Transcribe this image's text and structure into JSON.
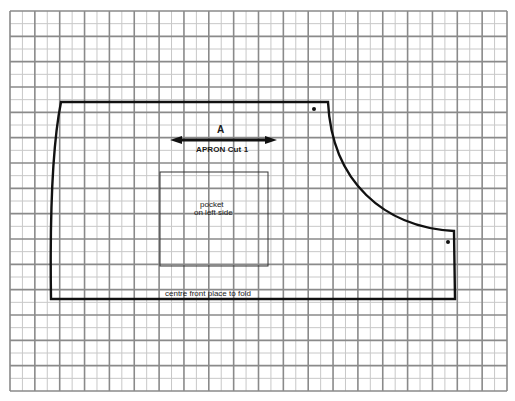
{
  "diagram": {
    "type": "sewing-pattern",
    "grid": {
      "left": 10,
      "top": 11,
      "right": 507,
      "bottom": 391,
      "major_cols": 20,
      "major_rows": 15,
      "minor_per_major": 2,
      "major_color": "#8a8a8a",
      "minor_color": "#c8c8c8"
    },
    "pattern_piece": {
      "name": "APRON",
      "stroke_color": "#111111",
      "outline_points": {
        "top_left": [
          61,
          102
        ],
        "top_right": [
          328,
          102
        ],
        "curve_end": [
          454,
          231
        ],
        "right_bottom": [
          455,
          299
        ],
        "bottom_left": [
          51,
          299
        ]
      }
    },
    "labels": {
      "grainline_letter": "A",
      "piece_title": "APRON Cut 1",
      "pocket_line1": "pocket",
      "pocket_line2": "on left side",
      "fold_edge": "centre front place to fold"
    },
    "grainline_arrow": {
      "x1": 170,
      "x2": 277,
      "y": 140
    },
    "pocket": {
      "x": 160,
      "y": 172,
      "width": 108,
      "height": 94
    },
    "markers": [
      {
        "name": "dot-top",
        "x": 314,
        "y": 109
      },
      {
        "name": "dot-right",
        "x": 448,
        "y": 242
      }
    ]
  }
}
